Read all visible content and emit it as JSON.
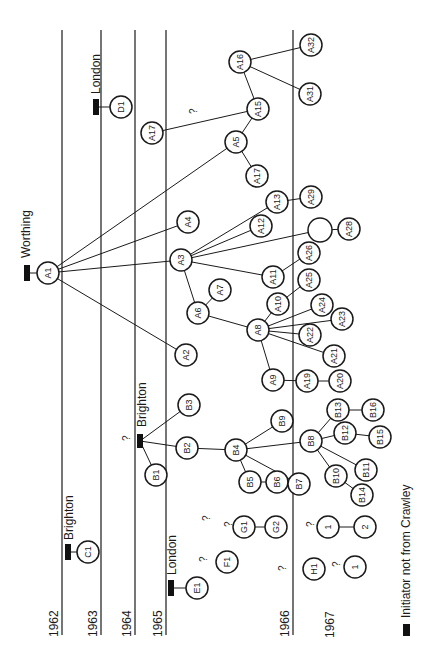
{
  "years": [
    {
      "label": "1962",
      "x": 62
    },
    {
      "label": "1963",
      "x": 101
    },
    {
      "label": "1964",
      "x": 135
    },
    {
      "label": "1965",
      "x": 166
    },
    {
      "label": "1966",
      "x": 293
    },
    {
      "label": "1967",
      "x": 338
    }
  ],
  "origins": [
    {
      "label": "Worthing",
      "x": 27,
      "y": 273
    },
    {
      "label": "London",
      "x": 96,
      "y": 75
    },
    {
      "label": "Brighton",
      "x": 140,
      "y": 440
    },
    {
      "label": "Brighton",
      "x": 68,
      "y": 552
    },
    {
      "label": "London",
      "x": 171,
      "y": 588
    }
  ],
  "legend": {
    "label": "Initiator not from Crawley"
  },
  "nodes": [
    {
      "id": "A1",
      "x": 48,
      "y": 273
    },
    {
      "id": "A2",
      "x": 186,
      "y": 355
    },
    {
      "id": "A3",
      "x": 181,
      "y": 260
    },
    {
      "id": "A4",
      "x": 188,
      "y": 222
    },
    {
      "id": "A5",
      "x": 236,
      "y": 142
    },
    {
      "id": "A6",
      "x": 198,
      "y": 313
    },
    {
      "id": "A7",
      "x": 220,
      "y": 290
    },
    {
      "id": "A8",
      "x": 258,
      "y": 330
    },
    {
      "id": "A9",
      "x": 273,
      "y": 380
    },
    {
      "id": "A10",
      "x": 278,
      "y": 304
    },
    {
      "id": "A11",
      "x": 273,
      "y": 277
    },
    {
      "id": "A12",
      "x": 261,
      "y": 226
    },
    {
      "id": "A13",
      "x": 277,
      "y": 202
    },
    {
      "id": "A15",
      "x": 258,
      "y": 109
    },
    {
      "id": "A16",
      "x": 240,
      "y": 62
    },
    {
      "id": "A17",
      "x": 152,
      "y": 133
    },
    {
      "id": "A17b",
      "label": "A17",
      "x": 257,
      "y": 176
    },
    {
      "id": "A19",
      "x": 307,
      "y": 381
    },
    {
      "id": "A20",
      "x": 340,
      "y": 381
    },
    {
      "id": "A21",
      "x": 334,
      "y": 356
    },
    {
      "id": "A22",
      "x": 310,
      "y": 335
    },
    {
      "id": "A23",
      "x": 342,
      "y": 319
    },
    {
      "id": "A24",
      "x": 322,
      "y": 305
    },
    {
      "id": "A25",
      "x": 309,
      "y": 280
    },
    {
      "id": "A26",
      "x": 309,
      "y": 253
    },
    {
      "id": "UNK",
      "label": "",
      "x": 320,
      "y": 230,
      "r": 12
    },
    {
      "id": "A28",
      "x": 349,
      "y": 229
    },
    {
      "id": "A29",
      "x": 311,
      "y": 197
    },
    {
      "id": "A31",
      "x": 310,
      "y": 94
    },
    {
      "id": "A32",
      "x": 311,
      "y": 45
    },
    {
      "id": "B1",
      "x": 156,
      "y": 475
    },
    {
      "id": "B2",
      "x": 187,
      "y": 448
    },
    {
      "id": "B3",
      "x": 189,
      "y": 405
    },
    {
      "id": "B4",
      "x": 236,
      "y": 450
    },
    {
      "id": "B5",
      "x": 250,
      "y": 482
    },
    {
      "id": "B6",
      "x": 277,
      "y": 482
    },
    {
      "id": "B7",
      "x": 299,
      "y": 484
    },
    {
      "id": "B8",
      "x": 311,
      "y": 441
    },
    {
      "id": "B9",
      "x": 282,
      "y": 421
    },
    {
      "id": "B10",
      "x": 336,
      "y": 476
    },
    {
      "id": "B11",
      "x": 366,
      "y": 470
    },
    {
      "id": "B12",
      "x": 345,
      "y": 433
    },
    {
      "id": "B13",
      "x": 338,
      "y": 410
    },
    {
      "id": "B14",
      "x": 362,
      "y": 495
    },
    {
      "id": "B15",
      "x": 380,
      "y": 437
    },
    {
      "id": "B16",
      "x": 373,
      "y": 410
    },
    {
      "id": "C1",
      "x": 88,
      "y": 552
    },
    {
      "id": "D1",
      "x": 121,
      "y": 107
    },
    {
      "id": "E1",
      "x": 197,
      "y": 588
    },
    {
      "id": "F1",
      "x": 227,
      "y": 562
    },
    {
      "id": "G1",
      "x": 244,
      "y": 527
    },
    {
      "id": "G2",
      "x": 276,
      "y": 527
    },
    {
      "id": "H1",
      "x": 314,
      "y": 569
    },
    {
      "id": "X1",
      "label": "1",
      "x": 328,
      "y": 527
    },
    {
      "id": "X2",
      "label": "2",
      "x": 365,
      "y": 527
    },
    {
      "id": "X3",
      "label": "1",
      "x": 355,
      "y": 567
    }
  ],
  "edges": [
    [
      "A1",
      "A2"
    ],
    [
      "A1",
      "A3"
    ],
    [
      "A1",
      "A4"
    ],
    [
      "A1",
      "A5"
    ],
    [
      "A3",
      "A6"
    ],
    [
      "A3",
      "A11"
    ],
    [
      "A3",
      "A12"
    ],
    [
      "A3",
      "A13"
    ],
    [
      "A3",
      "UNK"
    ],
    [
      "A6",
      "A7"
    ],
    [
      "A6",
      "A8"
    ],
    [
      "A8",
      "A9"
    ],
    [
      "A8",
      "A10"
    ],
    [
      "A8",
      "A21"
    ],
    [
      "A8",
      "A22"
    ],
    [
      "A8",
      "A23"
    ],
    [
      "A8",
      "A24"
    ],
    [
      "A9",
      "A19"
    ],
    [
      "A19",
      "A20"
    ],
    [
      "A10",
      "A25"
    ],
    [
      "A11",
      "A26"
    ],
    [
      "A13",
      "A29"
    ],
    [
      "UNK",
      "A28"
    ],
    [
      "A5",
      "A15"
    ],
    [
      "A5",
      "A17b"
    ],
    [
      "A15",
      "A16"
    ],
    [
      "A15",
      "A17"
    ],
    [
      "A16",
      "A31"
    ],
    [
      "A16",
      "A32"
    ],
    [
      "B2",
      "B4"
    ],
    [
      "B4",
      "B5"
    ],
    [
      "B4",
      "B7"
    ],
    [
      "B4",
      "B8"
    ],
    [
      "B4",
      "B9"
    ],
    [
      "B5",
      "B6"
    ],
    [
      "B8",
      "B10"
    ],
    [
      "B8",
      "B11"
    ],
    [
      "B8",
      "B12"
    ],
    [
      "B8",
      "B13"
    ],
    [
      "B10",
      "B14"
    ],
    [
      "B12",
      "B15"
    ],
    [
      "B13",
      "B16"
    ],
    [
      "G1",
      "G2"
    ],
    [
      "X1",
      "X2"
    ]
  ],
  "question_marks": [
    {
      "x": 197,
      "y": 114
    },
    {
      "x": 130,
      "y": 441
    },
    {
      "x": 207,
      "y": 562
    },
    {
      "x": 232,
      "y": 527
    },
    {
      "x": 286,
      "y": 571
    },
    {
      "x": 314,
      "y": 527
    },
    {
      "x": 340,
      "y": 567
    },
    {
      "x": 210,
      "y": 521
    }
  ],
  "chart_data": {
    "type": "network",
    "title": "",
    "axis": "years (vertical lines)",
    "years": [
      "1962",
      "1963",
      "1964",
      "1965",
      "1966",
      "1967"
    ],
    "groups": {
      "A": "initiated from Worthing (A1), 1962",
      "B": "initiated from Brighton (B1), 1964",
      "C": "C1 from Brighton, 1962",
      "D": "D1 from London, 1963",
      "E": "E1 from London, 1965",
      "F": "F1, 1965",
      "G": "G1–G2, 1965",
      "H": "H1, 1966"
    }
  }
}
